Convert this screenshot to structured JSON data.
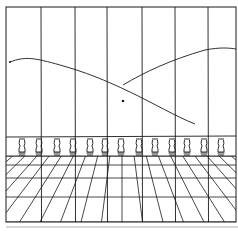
{
  "figure": {
    "title": "",
    "colors": {
      "ink": "#1a1a1a",
      "background": "#ffffff",
      "rule": "#b0b0b0"
    },
    "frame": {
      "x": 6,
      "y": 7,
      "w": 230,
      "h": 215
    },
    "verticals_x": [
      41,
      75,
      107,
      142,
      175,
      208
    ],
    "balusters_x": [
      22,
      39,
      57,
      73,
      90,
      105,
      121,
      139,
      155,
      172,
      187,
      204,
      221
    ],
    "dot": {
      "x": 123,
      "y": 101
    },
    "balustrade_top_y": 137,
    "floor_top_y": 156,
    "floor_rows_y": [
      156,
      165,
      178,
      197,
      222
    ],
    "vanishing_x": 122
  }
}
